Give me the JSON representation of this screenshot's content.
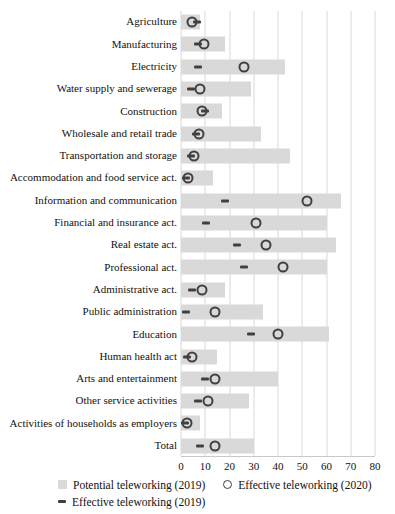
{
  "chart_data": {
    "type": "bar",
    "orientation": "horizontal",
    "title": "",
    "xlabel": "",
    "ylabel": "",
    "xlim": [
      0,
      80
    ],
    "xticks": [
      0,
      10,
      20,
      30,
      40,
      50,
      60,
      70,
      80
    ],
    "grid": true,
    "legend_position": "bottom",
    "categories": [
      "Agriculture",
      "Manufacturing",
      "Electricity",
      "Water supply and sewerage",
      "Construction",
      "Wholesale and retail trade",
      "Transportation and storage",
      "Accommodation and food service act.",
      "Information and communication",
      "Financial and insurance act.",
      "Real estate act.",
      "Professional act.",
      "Administrative act.",
      "Public administration",
      "Education",
      "Human health act",
      "Arts and entertainment",
      "Other service activities",
      "Activities of households as employers",
      "Total"
    ],
    "series": [
      {
        "name": "Potential teleworking (2019)",
        "marker": "bar",
        "color": "#d9d9d9",
        "values": [
          8,
          18,
          43,
          29,
          17,
          33,
          45,
          13,
          66,
          60,
          64,
          60,
          18,
          34,
          61,
          15,
          40,
          28,
          8,
          30
        ]
      },
      {
        "name": "Effective teleworking (2020)",
        "marker": "circle",
        "color": "#404040",
        "values": [
          4.5,
          9.5,
          26,
          8,
          8.5,
          7.5,
          5.5,
          3,
          52,
          31,
          35,
          42,
          8.5,
          14,
          40,
          4.5,
          14,
          11,
          2.5,
          14
        ]
      },
      {
        "name": "Effective teleworking (2019)",
        "marker": "dash",
        "color": "#404040",
        "values": [
          6.5,
          7,
          7,
          4,
          10,
          6,
          4,
          2,
          18,
          10.5,
          23,
          26,
          4.5,
          2,
          29,
          2.5,
          10,
          7,
          1.5,
          8
        ]
      }
    ]
  }
}
